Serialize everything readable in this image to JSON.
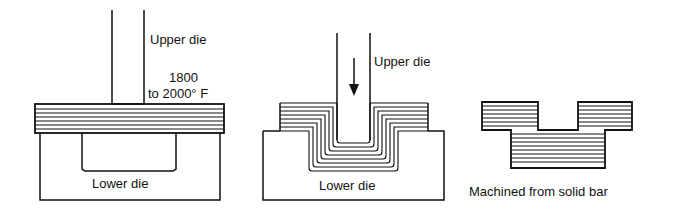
{
  "colors": {
    "ink": "#111111",
    "background": "#ffffff"
  },
  "panels": [
    {
      "id": "open-die-start",
      "labels": {
        "upper_die": "Upper die",
        "temp_line1": "1800",
        "temp_line2": "to 2000° F",
        "lower_die": "Lower die"
      }
    },
    {
      "id": "forging-in-progress",
      "labels": {
        "upper_die": "Upper die",
        "lower_die": "Lower die"
      },
      "icons": {
        "direction": "arrow-down-icon"
      }
    },
    {
      "id": "machined-comparison",
      "labels": {
        "caption": "Machined from solid bar"
      }
    }
  ]
}
